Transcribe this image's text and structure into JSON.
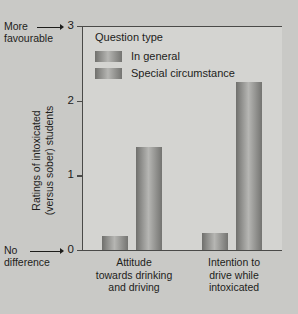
{
  "chart_data": {
    "type": "bar",
    "title": "",
    "xlabel": "",
    "ylabel": "Ratings of intoxicated (versus sober) students",
    "ylim": [
      0,
      3
    ],
    "yticks": [
      "0",
      "1",
      "2",
      "3"
    ],
    "grid": false,
    "legend_position": "top-left-inside",
    "legend_title": "Question type",
    "categories": [
      "Attitude towards drinking and driving",
      "Intention to drive while intoxicated"
    ],
    "series": [
      {
        "name": "In general",
        "values": [
          0.19,
          0.23
        ],
        "color": "#8e8e8b"
      },
      {
        "name": "Special circumstance",
        "values": [
          1.38,
          2.25
        ],
        "color": "#8e8e8b"
      }
    ],
    "annotations": [
      {
        "text": "More favourable",
        "points_to": "3"
      },
      {
        "text": "No difference",
        "points_to": "0"
      }
    ]
  },
  "axis": {
    "tick_labels": [
      "3",
      "2",
      "1",
      "0"
    ]
  },
  "annotations": {
    "top_line1": "More",
    "top_line2": "favourable",
    "bottom_line1": "No",
    "bottom_line2": "difference"
  },
  "y_title": {
    "line1": "Ratings of intoxicated",
    "line2": "(versus sober) students"
  },
  "legend": {
    "title": "Question type",
    "items": [
      {
        "label": "In general"
      },
      {
        "label": "Special circumstance"
      }
    ]
  },
  "categories": [
    {
      "line1": "Attitude",
      "line2": "towards drinking",
      "line3": "and driving"
    },
    {
      "line1": "Intention to",
      "line2": "drive while",
      "line3": "intoxicated"
    }
  ],
  "colors": {
    "background": "#c9c9c6",
    "plot_background": "#d4d4d1",
    "bar": "#8e8e8b",
    "axis": "#4a4a48",
    "text": "#1d1d1b"
  }
}
